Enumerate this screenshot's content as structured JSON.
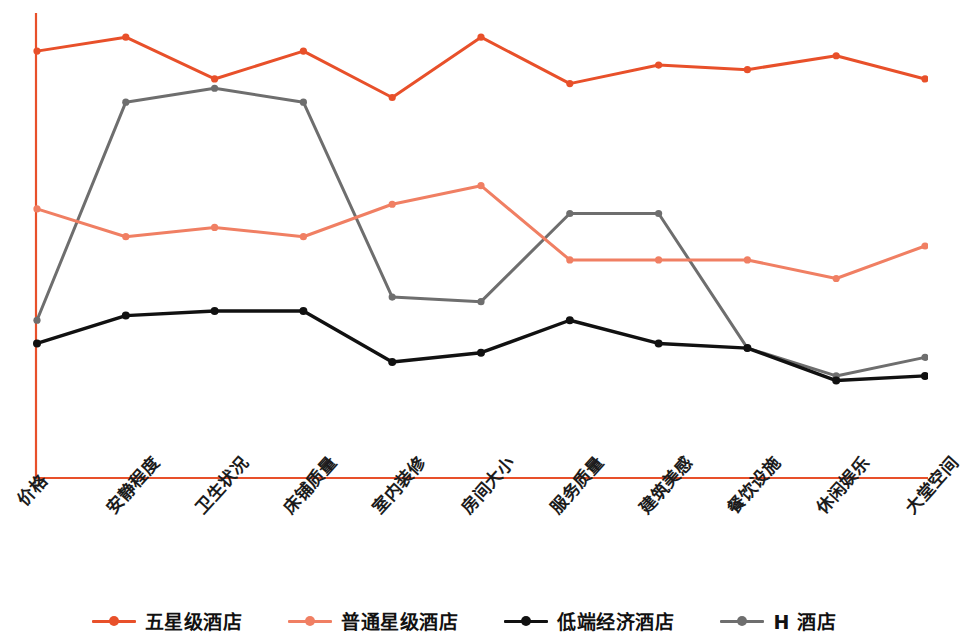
{
  "chart_data": {
    "type": "line",
    "title": "",
    "subtitle": "",
    "xlabel": "",
    "ylabel": "",
    "grid": false,
    "legend_position": "bottom",
    "ylim": [
      0,
      100
    ],
    "axis_color": "#E8502A",
    "categories": [
      "价格",
      "安静程度",
      "卫生状况",
      "床铺质量",
      "室内装修",
      "房间大小",
      "服务质量",
      "建筑美感",
      "餐饮设施",
      "休闲娱乐",
      "大堂空间"
    ],
    "series": [
      {
        "name": "五星级酒店",
        "color": "#E8502A",
        "values": [
          92,
          95,
          86,
          92,
          82,
          95,
          85,
          89,
          88,
          91,
          86
        ]
      },
      {
        "name": "普通星级酒店",
        "color": "#F07F63",
        "values": [
          58,
          52,
          54,
          52,
          59,
          63,
          47,
          47,
          47,
          43,
          50
        ]
      },
      {
        "name": "低端经济酒店",
        "color": "#111111",
        "values": [
          29,
          35,
          36,
          36,
          25,
          27,
          34,
          29,
          28,
          21,
          22
        ]
      },
      {
        "name": "H 酒店",
        "color": "#6E6E6E",
        "values": [
          34,
          81,
          84,
          81,
          39,
          38,
          57,
          57,
          28,
          22,
          26
        ]
      }
    ]
  },
  "legend": {
    "items": [
      {
        "label": "五星级酒店",
        "color": "#E8502A"
      },
      {
        "label": "普通星级酒店",
        "color": "#F07F63"
      },
      {
        "label": "低端经济酒店",
        "color": "#111111"
      },
      {
        "label": "H 酒店",
        "color": "#6E6E6E"
      }
    ]
  }
}
